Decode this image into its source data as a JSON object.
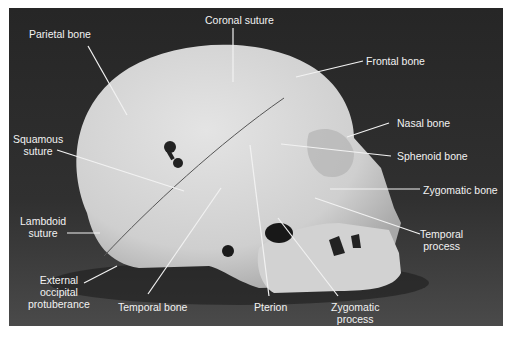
{
  "figure": {
    "background_color": "#2a2a2a",
    "bone_color": "#d6d6d6",
    "label_color": "#f2f2f2"
  },
  "labels": [
    {
      "id": "parietal-bone",
      "text": "Parietal bone",
      "x": 29,
      "y": 28,
      "lines": [
        "Parietal bone"
      ],
      "leader": [
        [
          88,
          46
        ],
        [
          127,
          115
        ]
      ]
    },
    {
      "id": "coronal-suture",
      "text": "Coronal suture",
      "x": 205,
      "y": 14,
      "lines": [
        "Coronal suture"
      ],
      "leader": [
        [
          233,
          28
        ],
        [
          233,
          82
        ]
      ]
    },
    {
      "id": "frontal-bone",
      "text": "Frontal bone",
      "x": 366,
      "y": 55,
      "lines": [
        "Frontal bone"
      ],
      "leader": [
        [
          363,
          61
        ],
        [
          296,
          77
        ]
      ]
    },
    {
      "id": "squamous-suture",
      "text": "Squamous suture",
      "x": 13,
      "y": 133,
      "lines": [
        "Squamous",
        "suture"
      ],
      "leader": [
        [
          57,
          150
        ],
        [
          184,
          191
        ]
      ]
    },
    {
      "id": "nasal-bone",
      "text": "Nasal bone",
      "x": 397,
      "y": 117,
      "lines": [
        "Nasal bone"
      ],
      "leader": [
        [
          389,
          123
        ],
        [
          347,
          137
        ]
      ]
    },
    {
      "id": "sphenoid-bone",
      "text": "Sphenoid bone",
      "x": 397,
      "y": 150,
      "lines": [
        "Sphenoid bone"
      ],
      "leader": [
        [
          391,
          156
        ],
        [
          281,
          144
        ]
      ]
    },
    {
      "id": "zygomatic-bone",
      "text": "Zygomatic bone",
      "x": 423,
      "y": 184,
      "lines": [
        "Zygomatic bone"
      ],
      "leader": [
        [
          420,
          189
        ],
        [
          330,
          189
        ]
      ]
    },
    {
      "id": "lambdoid-suture",
      "text": "Lambdoid suture",
      "x": 20,
      "y": 215,
      "lines": [
        "Lambdoid",
        "suture"
      ],
      "leader": [
        [
          67,
          233
        ],
        [
          100,
          233
        ]
      ]
    },
    {
      "id": "temporal-process",
      "text": "Temporal process",
      "x": 420,
      "y": 228,
      "lines": [
        "Temporal",
        "process"
      ],
      "leader": [
        [
          420,
          234
        ],
        [
          315,
          198
        ]
      ]
    },
    {
      "id": "external-occipital-protuberance",
      "text": "External occipital protuberance",
      "x": 28,
      "y": 274,
      "lines": [
        "External",
        "occipital",
        "protuberance"
      ],
      "leader": [
        [
          84,
          283
        ],
        [
          117,
          266
        ]
      ]
    },
    {
      "id": "temporal-bone",
      "text": "Temporal bone",
      "x": 118,
      "y": 301,
      "lines": [
        "Temporal bone"
      ],
      "leader": [
        [
          148,
          294
        ],
        [
          221,
          188
        ]
      ]
    },
    {
      "id": "pterion",
      "text": "Pterion",
      "x": 254,
      "y": 301,
      "lines": [
        "Pterion"
      ],
      "leader": [
        [
          269,
          296
        ],
        [
          250,
          145
        ]
      ]
    },
    {
      "id": "zygomatic-process",
      "text": "Zygomatic process",
      "x": 331,
      "y": 301,
      "lines": [
        "Zygomatic",
        "process"
      ],
      "leader": [
        [
          338,
          296
        ],
        [
          278,
          218
        ]
      ]
    }
  ]
}
